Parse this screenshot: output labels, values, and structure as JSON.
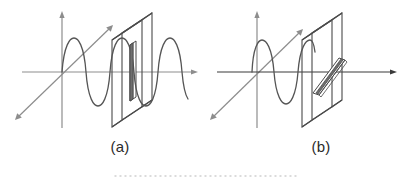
{
  "figure": {
    "background_color": "#ffffff",
    "line_color": "#4a4a4a",
    "axis_color": "#8d8d8d",
    "wave_color": "#555555",
    "slit_fill_color": "#6e6e6e",
    "dotted_rule_color": "#cfcfcf",
    "panels": [
      {
        "id": "a",
        "caption": "(a)",
        "icon_names": [
          "y-axis-arrow-icon",
          "z-axis-arrow-icon",
          "x-axis-arrow-icon",
          "sine-wave-icon",
          "polarizer-plate-icon",
          "vertical-slit-icon"
        ],
        "slit_orientation": "vertical",
        "wave_plane": "vertical",
        "wave_passes_through": true,
        "wave_label": "vertically polarized wave passes the vertical slit",
        "axes": [
          {
            "name": "y-axis",
            "direction": "up",
            "arrow": true
          },
          {
            "name": "z-axis",
            "direction": "up-right-diagonal",
            "arrow": true
          },
          {
            "name": "x-axis",
            "direction": "right",
            "arrow": true
          }
        ]
      },
      {
        "id": "b",
        "caption": "(b)",
        "icon_names": [
          "y-axis-arrow-icon",
          "z-axis-arrow-icon",
          "x-axis-arrow-icon",
          "sine-wave-icon",
          "polarizer-plate-icon",
          "diagonal-slit-icon"
        ],
        "slit_orientation": "diagonal",
        "wave_plane": "vertical",
        "wave_passes_through": false,
        "wave_label": "vertically polarized wave blocked by the rotated slit",
        "axes": [
          {
            "name": "y-axis",
            "direction": "up",
            "arrow": true
          },
          {
            "name": "z-axis",
            "direction": "up-right-diagonal",
            "arrow": true
          },
          {
            "name": "x-axis",
            "direction": "right",
            "arrow": true
          }
        ]
      }
    ],
    "footer_rule": {
      "name": "dotted-separator",
      "style": "dotted",
      "x_start": 115,
      "x_end": 296,
      "y": 176
    }
  }
}
